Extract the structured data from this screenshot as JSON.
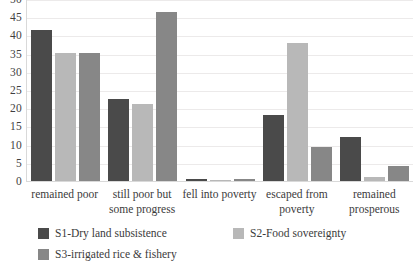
{
  "chart_data": {
    "type": "bar",
    "title": "",
    "subtitle": "",
    "xlabel": "",
    "ylabel": "",
    "ylim": [
      0,
      50
    ],
    "yticks": [
      50,
      45,
      40,
      35,
      30,
      25,
      20,
      15,
      10,
      5,
      0
    ],
    "grid": true,
    "legend_position": "bottom",
    "categories": [
      "remained poor",
      "still poor but some progress",
      "fell into poverty",
      "escaped from poverty",
      "remained prosperous"
    ],
    "series": [
      {
        "name": "S1-Dry land subsistence",
        "color": "#4a4a4a",
        "values": [
          41.7,
          22.7,
          0.7,
          18.3,
          12.4
        ]
      },
      {
        "name": "S2-Food sovereignty",
        "color": "#b8b8b8",
        "values": [
          35.4,
          21.5,
          0.6,
          38.2,
          1.4
        ]
      },
      {
        "name": "S3-irrigated rice & fishery",
        "color": "#878787",
        "values": [
          35.4,
          46.7,
          0.7,
          9.6,
          4.4
        ]
      }
    ]
  },
  "colors": {
    "background": "#ffffff",
    "text": "#3b3b3b",
    "gridline": "#eceaea",
    "axis": "#d9d9d9"
  }
}
